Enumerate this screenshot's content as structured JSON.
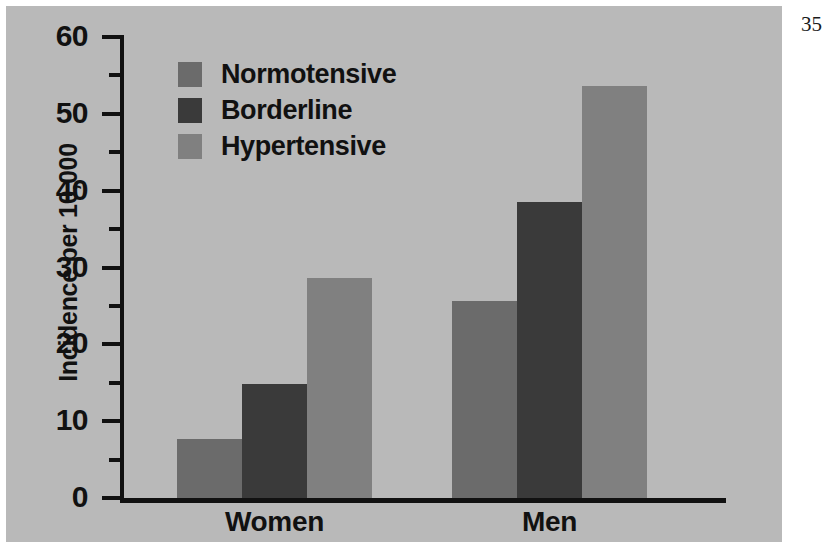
{
  "page_number": "35",
  "chart_data": {
    "type": "bar",
    "title": "",
    "xlabel": "",
    "ylabel": "Incidence per 10,000",
    "categories": [
      "Women",
      "Men"
    ],
    "series": [
      {
        "name": "Normotensive",
        "color": "#6b6b6b",
        "values": [
          7.7,
          25.7
        ]
      },
      {
        "name": "Borderline",
        "color": "#3a3a3a",
        "values": [
          14.8,
          38.5
        ]
      },
      {
        "name": "Hypertensive",
        "color": "#808080",
        "values": [
          28.7,
          53.6
        ]
      }
    ],
    "ylim": [
      0,
      60
    ],
    "ytick_labels": [
      "0",
      "10",
      "20",
      "30",
      "40",
      "50",
      "60"
    ],
    "ytick_values": [
      0,
      10,
      20,
      30,
      40,
      50,
      60
    ],
    "yminor_values": [
      5,
      15,
      25,
      35,
      45,
      55
    ],
    "grid": false,
    "legend_position": "upper-left-inside",
    "background_color": "#b9b9b9",
    "axis_color": "#111111"
  }
}
